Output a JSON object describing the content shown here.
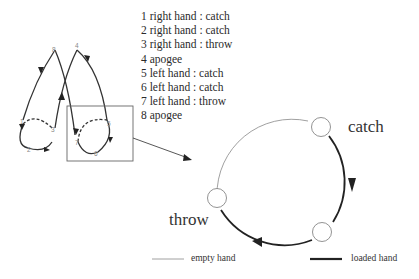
{
  "legend_items": [
    {
      "num": "1",
      "text": "right hand : catch"
    },
    {
      "num": "2",
      "text": "right hand : catch"
    },
    {
      "num": "3",
      "text": "right hand : throw"
    },
    {
      "num": "4",
      "text": "apogee"
    },
    {
      "num": "5",
      "text": "left hand : catch"
    },
    {
      "num": "6",
      "text": "left hand : catch"
    },
    {
      "num": "7",
      "text": "left hand : throw"
    },
    {
      "num": "8",
      "text": "apogee"
    }
  ],
  "small_diagram": {
    "points": [
      "1",
      "2",
      "3",
      "4",
      "5",
      "6",
      "7",
      "8"
    ]
  },
  "large_diagram": {
    "catch_label": "catch",
    "throw_label": "throw"
  },
  "key": {
    "empty_hand": "empty hand",
    "loaded_hand": "loaded hand"
  },
  "colors": {
    "line": "#333333",
    "thin_line": "#888888",
    "text": "#2a2a2a"
  }
}
